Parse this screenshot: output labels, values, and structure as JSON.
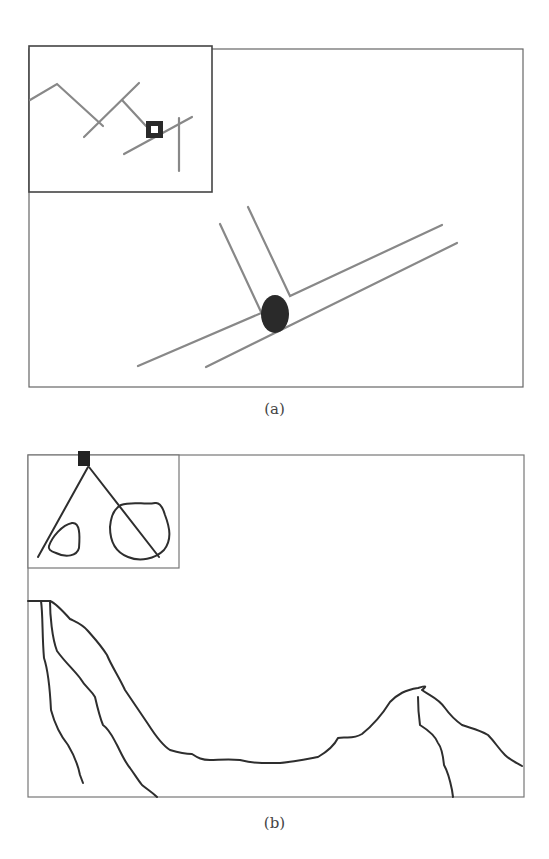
{
  "figure": {
    "panels": [
      {
        "id": "a",
        "caption": "(a)",
        "description": "Main view with two parallel slanted lines joined by branch lines at a dark elliptical node; inset shows zoomed-out path with square marker",
        "colors": {
          "frame": "#555555",
          "line": "#777777",
          "node": "#2a2a2a"
        }
      },
      {
        "id": "b",
        "caption": "(b)",
        "description": "Main view with wavy terrain-like contour curves; inset shows square marker with two rays over two closed loops",
        "colors": {
          "frame": "#666666",
          "line": "#2e2e2e",
          "marker": "#222222"
        }
      }
    ]
  }
}
